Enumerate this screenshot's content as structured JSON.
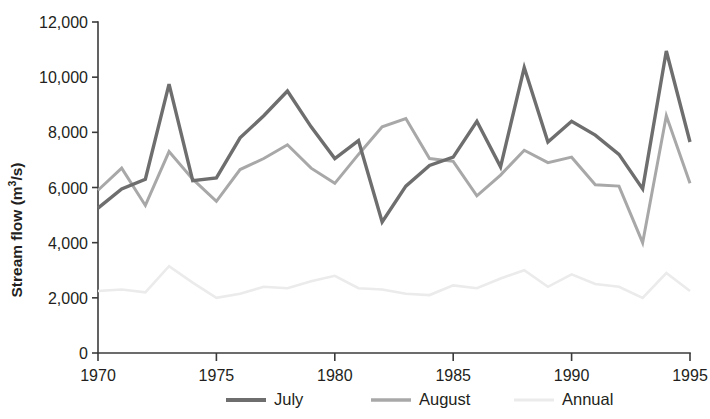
{
  "chart_data": {
    "type": "line",
    "title": "",
    "xlabel": "",
    "ylabel": "Stream flow (m3/s)",
    "ylabel_parts": {
      "pre": "Stream flow (m",
      "sup": "3",
      "post": "/s)"
    },
    "xlim": [
      1970,
      1995
    ],
    "ylim": [
      0,
      12000
    ],
    "grid": false,
    "legend_position": "bottom",
    "x_ticks": [
      1970,
      1975,
      1980,
      1985,
      1990,
      1995
    ],
    "x_tick_labels": [
      "1970",
      "1975",
      "1980",
      "1985",
      "1990",
      "1995"
    ],
    "y_ticks": [
      0,
      2000,
      4000,
      6000,
      8000,
      10000,
      12000
    ],
    "y_tick_labels": [
      "0",
      "2,000",
      "4,000",
      "6,000",
      "8,000",
      "10,000",
      "12,000"
    ],
    "x": [
      1970,
      1971,
      1972,
      1973,
      1974,
      1975,
      1976,
      1977,
      1978,
      1979,
      1980,
      1981,
      1982,
      1983,
      1984,
      1985,
      1986,
      1987,
      1988,
      1989,
      1990,
      1991,
      1992,
      1993,
      1994,
      1995
    ],
    "series": [
      {
        "name": "July",
        "color": "#6e6e6e",
        "width": 3.4,
        "values": [
          5250,
          5950,
          6300,
          9750,
          6250,
          6350,
          7800,
          8600,
          9500,
          8200,
          7050,
          7700,
          4750,
          6050,
          6800,
          7100,
          8400,
          6750,
          10350,
          7650,
          8400,
          7900,
          7200,
          5950,
          10950,
          7650
        ]
      },
      {
        "name": "August",
        "color": "#a8a8a8",
        "width": 3.0,
        "values": [
          5900,
          6700,
          5350,
          7300,
          6300,
          5500,
          6650,
          7050,
          7550,
          6700,
          6150,
          7200,
          8200,
          8500,
          7050,
          6950,
          5700,
          6450,
          7350,
          6900,
          7100,
          6100,
          6050,
          4000,
          8600,
          6150
        ]
      },
      {
        "name": "Annual",
        "color": "#ebebeb",
        "width": 2.6,
        "values": [
          2250,
          2300,
          2200,
          3150,
          2550,
          2000,
          2150,
          2400,
          2350,
          2600,
          2800,
          2350,
          2300,
          2150,
          2100,
          2450,
          2350,
          2700,
          3000,
          2400,
          2850,
          2500,
          2400,
          2000,
          2900,
          2250
        ]
      }
    ],
    "legend": [
      {
        "label": "July",
        "color": "#6e6e6e",
        "width": 4.2
      },
      {
        "label": "August",
        "color": "#a8a8a8",
        "width": 3.6
      },
      {
        "label": "Annual",
        "color": "#ebebeb",
        "width": 3.2
      }
    ]
  }
}
